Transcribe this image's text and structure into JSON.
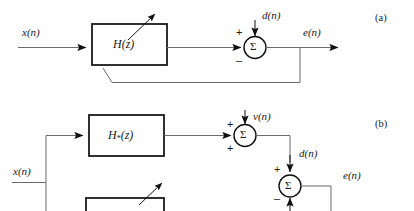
{
  "figure": {
    "type": "block-diagram",
    "line_color": "#4d4d4d",
    "block_border_color": "#1a1a1a",
    "text_color": "#1a1a1a",
    "background": "#fefefe"
  },
  "panel_a": {
    "tag": "(a)",
    "input_label": "x(n)",
    "block_label_base": "H",
    "block_label_arg": "(z)",
    "disturbance_label": "d(n)",
    "output_label": "e(n)",
    "sum_glyph": "Σ",
    "sign_top": "+",
    "sign_left": "–"
  },
  "panel_b": {
    "tag": "(b)",
    "input_label": "x(n)",
    "block_label_base": "H",
    "block_label_sub": "*",
    "block_label_arg": "(z)",
    "noise_label": "v(n)",
    "mid_label": "d(n)",
    "output_label": "e(n)",
    "sum_glyph": "Σ",
    "sum1_sign_top": "+",
    "sum1_sign_bottom": "+",
    "sum2_sign_top": "+",
    "sum2_sign_bottom": "–"
  }
}
